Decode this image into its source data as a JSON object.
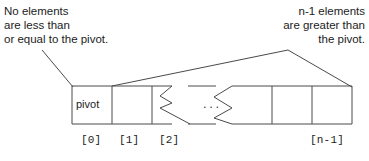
{
  "diagram": {
    "annotations": {
      "left": {
        "line1": "No elements",
        "line2": "are less than",
        "line3": "or equal to the pivot."
      },
      "right": {
        "line1": "n-1 elements",
        "line2": "are greater than",
        "line3": "the pivot."
      }
    },
    "array": {
      "pivot_label": "pivot",
      "ellipsis": "...",
      "indices": {
        "first": "[0]",
        "second": "[1]",
        "third": "[2]",
        "last": "[n-1]"
      }
    },
    "colors": {
      "stroke": "#4a4a4a",
      "text": "#1c1c1c",
      "background": "#ffffff"
    }
  }
}
